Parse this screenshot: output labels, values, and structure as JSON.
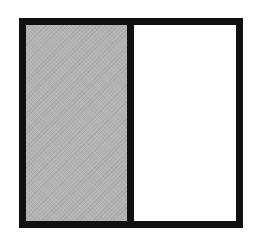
{
  "figure": {
    "total_parts": 2,
    "shaded_parts": 1,
    "parts": [
      {
        "index": 0,
        "shaded": true,
        "fill_color": "#b3b3b3"
      },
      {
        "index": 1,
        "shaded": false,
        "fill_color": "#ffffff"
      }
    ],
    "border_color": "#111111"
  }
}
